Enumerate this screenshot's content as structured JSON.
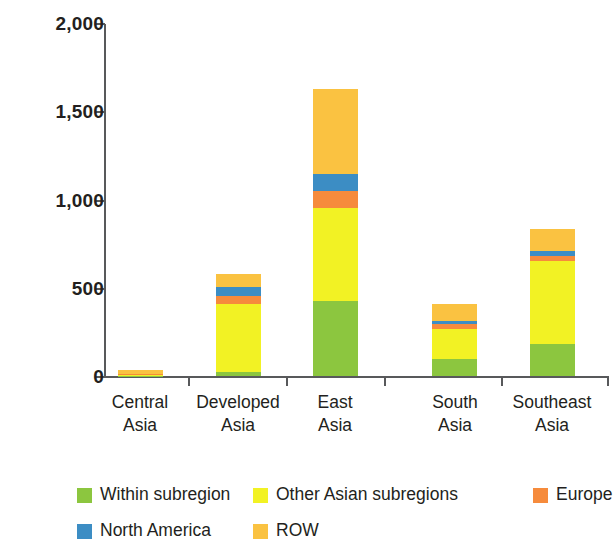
{
  "chart_data": {
    "type": "bar",
    "stacked": true,
    "title": "",
    "subtitle": "",
    "xlabel": "",
    "ylabel": "",
    "ylim": [
      0,
      2000
    ],
    "yticks": [
      0,
      500,
      1000,
      1500,
      2000
    ],
    "ytick_labels": [
      "0",
      "500",
      "1,000",
      "1,500",
      "2,000"
    ],
    "grid": false,
    "legend_position": "bottom",
    "categories": [
      "Central Asia",
      "Developed Asia",
      "East Asia",
      "South Asia",
      "Southeast Asia"
    ],
    "category_lines": [
      [
        "Central",
        "Asia"
      ],
      [
        "Developed",
        "Asia"
      ],
      [
        "East",
        "Asia"
      ],
      [
        "South",
        "Asia"
      ],
      [
        "Southeast",
        "Asia"
      ]
    ],
    "series": [
      {
        "name": "Within subregion",
        "color": "#8CC63F",
        "values": [
          2,
          25,
          425,
          95,
          180
        ]
      },
      {
        "name": "Other Asian subregions",
        "color": "#F2F224",
        "values": [
          6,
          385,
          527,
          170,
          470
        ]
      },
      {
        "name": "Europe",
        "color": "#F68B3C",
        "values": [
          4,
          45,
          96,
          27,
          28
        ]
      },
      {
        "name": "North America",
        "color": "#3C8DC4",
        "values": [
          2,
          50,
          97,
          20,
          30
        ]
      },
      {
        "name": "ROW",
        "color": "#FAC241",
        "values": [
          20,
          73,
          480,
          96,
          125
        ]
      }
    ],
    "totals": [
      34,
      578,
      1625,
      408,
      833
    ]
  },
  "legend": {
    "entries": [
      {
        "label": "Within subregion",
        "color": "#8CC63F"
      },
      {
        "label": "Other Asian subregions",
        "color": "#F2F224"
      },
      {
        "label": "Europe",
        "color": "#F68B3C"
      },
      {
        "label": "North America",
        "color": "#3C8DC4"
      },
      {
        "label": "ROW",
        "color": "#FAC241"
      }
    ]
  },
  "axis": {
    "axis_color": "#58595b"
  }
}
